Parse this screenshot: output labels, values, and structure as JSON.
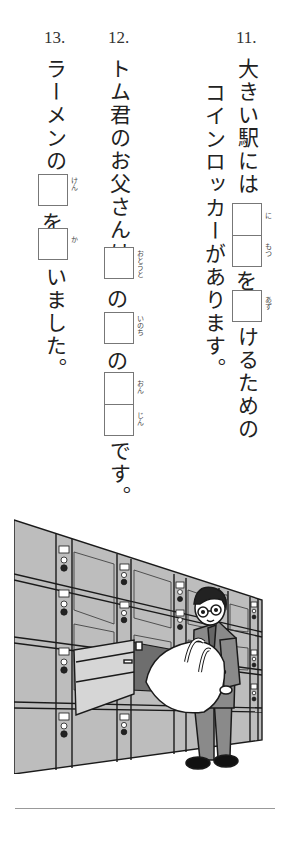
{
  "questions": [
    {
      "number": "11.",
      "line1_a": "大きい駅には",
      "boxes_a": [
        {
          "ruby": "に"
        },
        {
          "ruby": "もつ"
        }
      ],
      "particle_a": "を",
      "box_b": {
        "ruby": "あず"
      },
      "line1_b": "けるための",
      "line2": "コインロッカーがあります。"
    },
    {
      "number": "12.",
      "line1_a": "トム君のお父さんは",
      "box_a": {
        "ruby": "おとうと"
      },
      "particle_a": "の",
      "box_b": {
        "ruby": "いのち"
      },
      "particle_b": "の",
      "boxes_c": [
        {
          "ruby": "おん"
        },
        {
          "ruby": "じん"
        }
      ],
      "ending": "です。"
    },
    {
      "number": "13.",
      "line1_a": "ラーメンの",
      "box_a": {
        "ruby": "けん"
      },
      "particle_a": "を",
      "box_b": {
        "ruby": "か"
      },
      "ending": "いました。"
    }
  ],
  "illustration": {
    "description": "A man with glasses holding a large bag, placing it into an open coin locker in a wall of lockers",
    "colors": {
      "locker_fill": "#b8b8b8",
      "locker_dark": "#6e6e6e",
      "outline": "#1a1a1a",
      "bag": "#ffffff",
      "suit": "#8a8a8a"
    }
  }
}
